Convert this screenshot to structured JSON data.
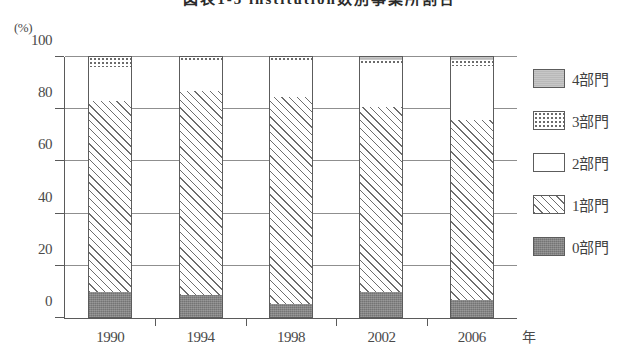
{
  "chart_data": {
    "type": "bar",
    "subtype": "stacked-bar-100pct",
    "title": "図表1-3 institution数別事業所割合",
    "xlabel": "年",
    "ylabel": "",
    "unit_label": "(%)",
    "ylim": [
      0,
      100
    ],
    "yticks": [
      0,
      20,
      40,
      60,
      80,
      100
    ],
    "ytick_labels": [
      "0",
      "20",
      "40",
      "60",
      "80",
      "100"
    ],
    "grid": true,
    "legend_position": "right",
    "categories": [
      "1990",
      "1994",
      "1998",
      "2002",
      "2006"
    ],
    "series": [
      {
        "name": "0部門",
        "pattern": "solid-dark-gray",
        "values": [
          10,
          9,
          5.5,
          10,
          7
        ]
      },
      {
        "name": "1部門",
        "pattern": "diagonal-hatch",
        "values": [
          73,
          78,
          79,
          71,
          69
        ]
      },
      {
        "name": "2部門",
        "pattern": "white",
        "values": [
          13,
          11,
          13.5,
          16,
          20.5
        ]
      },
      {
        "name": "3部門",
        "pattern": "dotted",
        "values": [
          4,
          2,
          2,
          2,
          2.5
        ]
      },
      {
        "name": "4部門",
        "pattern": "solid-light-gray",
        "values": [
          0,
          0,
          0,
          1,
          1
        ]
      }
    ],
    "cumulative_tops": {
      "1990": {
        "0部門": 10,
        "1部門": 83,
        "2部門": 96,
        "3部門": 100,
        "4部門": 100
      },
      "1994": {
        "0部門": 9,
        "1部門": 87,
        "2部門": 98,
        "3部門": 100,
        "4部門": 100
      },
      "1998": {
        "0部門": 5.5,
        "1部門": 84.5,
        "2部門": 98,
        "3部門": 100,
        "4部門": 100
      },
      "2002": {
        "0部門": 10,
        "1部門": 81,
        "2部門": 97,
        "3部門": 99,
        "4部門": 100
      },
      "2006": {
        "0部門": 7,
        "1部門": 76,
        "2部門": 96.5,
        "3部門": 99,
        "4部門": 100
      }
    }
  },
  "legend": {
    "items": [
      {
        "label": "4部門"
      },
      {
        "label": "3部門"
      },
      {
        "label": "2部門"
      },
      {
        "label": "1部門"
      },
      {
        "label": "0部門"
      }
    ]
  }
}
